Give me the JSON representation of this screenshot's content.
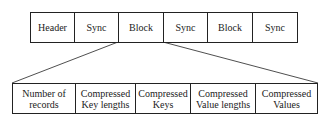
{
  "top_row": [
    "Header",
    "Sync",
    "Block",
    "Sync",
    "Block",
    "Sync"
  ],
  "bottom_row": [
    "Number of records",
    "Compressed Key lengths",
    "Compressed Keys",
    "Compressed Value lengths",
    "Compressed Values"
  ],
  "bottom_row_lines": [
    [
      "Number of",
      "records"
    ],
    [
      "Compressed",
      "Key lengths"
    ],
    [
      "Compressed",
      "Keys"
    ],
    [
      "Compressed",
      "Value lengths"
    ],
    [
      "Compressed",
      "Values"
    ]
  ]
}
